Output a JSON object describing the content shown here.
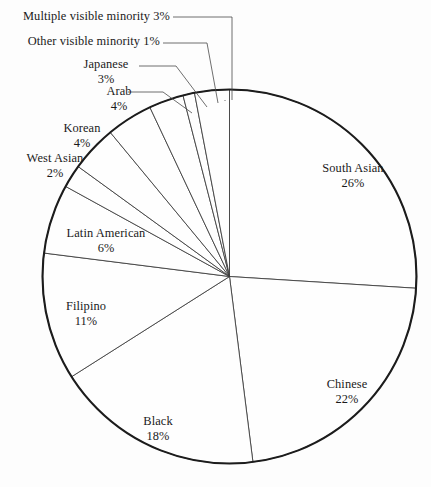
{
  "chart_data": {
    "type": "pie",
    "title": "",
    "subtitle": "",
    "xlabel": "",
    "ylabel": "",
    "legend_position": "none",
    "grid": false,
    "start_angle_deg": 0,
    "direction": "clockwise",
    "units": "percent",
    "total": 100,
    "categories": [
      "South Asian",
      "Chinese",
      "Black",
      "Filipino",
      "Latin American",
      "West Asian",
      "Korean",
      "Arab",
      "Japanese",
      "Other visible minority",
      "Multiple visible minority"
    ],
    "values": [
      26,
      22,
      18,
      11,
      6,
      2,
      4,
      4,
      3,
      1,
      3
    ],
    "slices": [
      {
        "label": "South Asian",
        "value": 26,
        "pct_text": "26%"
      },
      {
        "label": "Chinese",
        "value": 22,
        "pct_text": "22%"
      },
      {
        "label": "Black",
        "value": 18,
        "pct_text": "18%"
      },
      {
        "label": "Filipino",
        "value": 11,
        "pct_text": "11%"
      },
      {
        "label": "Latin American",
        "value": 6,
        "pct_text": "6%"
      },
      {
        "label": "West Asian",
        "value": 2,
        "pct_text": "2%"
      },
      {
        "label": "Korean",
        "value": 4,
        "pct_text": "4%"
      },
      {
        "label": "Arab",
        "value": 4,
        "pct_text": "4%"
      },
      {
        "label": "Japanese",
        "value": 3,
        "pct_text": "3%"
      },
      {
        "label": "Other visible minority",
        "value": 1,
        "pct_text": "1%"
      },
      {
        "label": "Multiple visible minority",
        "value": 3,
        "pct_text": "3%"
      }
    ],
    "colors": {
      "slice_fill": "#fefefe",
      "slice_stroke": "#3a3a3a",
      "outline_stroke": "#1c1c1c",
      "leader_stroke": "#4a4a4a",
      "text": "#1a1a1a",
      "background": "#fdfdfd"
    }
  },
  "labels": {
    "multiple_visible_minority": {
      "name": "Multiple visible minority",
      "pct": "3%",
      "combined": "Multiple visible minority 3%"
    },
    "other_visible_minority": {
      "name": "Other visible minority",
      "pct": "1%",
      "combined": "Other visible minority 1%"
    },
    "japanese": {
      "name": "Japanese",
      "pct": "3%"
    },
    "arab": {
      "name": "Arab",
      "pct": "4%"
    },
    "korean": {
      "name": "Korean",
      "pct": "4%"
    },
    "west_asian": {
      "name": "West Asian",
      "pct": "2%"
    },
    "latin_american": {
      "name": "Latin American",
      "pct": "6%"
    },
    "filipino": {
      "name": "Filipino",
      "pct": "11%"
    },
    "black": {
      "name": "Black",
      "pct": "18%"
    },
    "chinese": {
      "name": "Chinese",
      "pct": "22%"
    },
    "south_asian": {
      "name": "South Asian",
      "pct": "26%"
    }
  }
}
